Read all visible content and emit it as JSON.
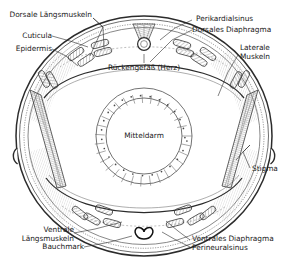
{
  "figure": {
    "title_visible": false,
    "language": "de",
    "line_color": "#222222",
    "label_color": "#1a1a1a",
    "background": "#ffffff"
  },
  "labels": {
    "dorsale_laengsmuskeln": "Dorsale Längsmuskeln",
    "cuticula": "Cuticula",
    "epidermis": "Epidermis",
    "perikardialsinus": "Perikardialsinus",
    "dorsales_diaphragma": "Dorsales Diaphragma",
    "laterale_muskeln_1": "Laterale",
    "laterale_muskeln_2": "Muskeln",
    "rueckengefaess": "Rückengefäß (Herz)",
    "mitteldarm": "Mitteldarm",
    "stigma": "Stigma",
    "ventrale_laengsmuskeln_1": "Ventrale",
    "ventrale_laengsmuskeln_2": "Längsmuskeln",
    "bauchmark": "Bauchmark",
    "ventrales_diaphragma": "Ventrales Diaphragma",
    "perineuralsinus": "Perineuralsinus"
  },
  "structures": [
    {
      "name": "body-wall-cuticula",
      "label": "Cuticula",
      "kind": "outline"
    },
    {
      "name": "body-wall-epidermis",
      "label": "Epidermis",
      "kind": "dotted-layer"
    },
    {
      "name": "dorsal-longitudinal-muscles",
      "label": "Dorsale Längsmuskeln",
      "kind": "muscle-bundle",
      "count": 6
    },
    {
      "name": "ventral-longitudinal-muscles",
      "label": "Ventrale Längsmuskeln",
      "kind": "muscle-bundle",
      "count": 6
    },
    {
      "name": "lateral-muscles",
      "label": "Laterale Muskeln",
      "kind": "muscle-wedge",
      "count": 2
    },
    {
      "name": "dorsal-diaphragm",
      "label": "Dorsales Diaphragma",
      "kind": "membrane"
    },
    {
      "name": "ventral-diaphragm",
      "label": "Ventrales Diaphragma",
      "kind": "membrane"
    },
    {
      "name": "pericardial-sinus",
      "label": "Perikardialsinus",
      "kind": "cavity"
    },
    {
      "name": "perineural-sinus",
      "label": "Perineuralsinus",
      "kind": "cavity"
    },
    {
      "name": "dorsal-vessel-heart",
      "label": "Rückengefäß (Herz)",
      "kind": "organ"
    },
    {
      "name": "midgut",
      "label": "Mitteldarm",
      "kind": "organ",
      "cells": 30
    },
    {
      "name": "ventral-nerve-cord",
      "label": "Bauchmark",
      "kind": "organ"
    },
    {
      "name": "spiracle",
      "label": "Stigma",
      "kind": "opening",
      "count": 2
    }
  ]
}
